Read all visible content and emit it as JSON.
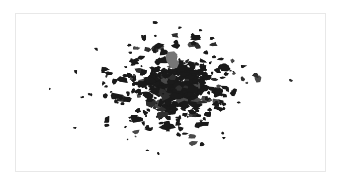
{
  "figure": {
    "kind": "map-footprint-plot",
    "title": "",
    "background_color": "#ffffff",
    "frame": {
      "visible": true,
      "border_color": "#e8e8e8",
      "x": 15,
      "y": 13,
      "width": 311,
      "height": 159
    },
    "axes": {
      "visible": false,
      "ticks": false,
      "labels": false,
      "gridlines": false
    },
    "legend": {
      "visible": false
    }
  },
  "chart_data": {
    "type": "scatter",
    "title": "",
    "subtitle": "",
    "xlabel": "",
    "ylabel": "",
    "xlim": [
      0,
      311
    ],
    "ylim": [
      0,
      159
    ],
    "grid": false,
    "legend_position": "none",
    "marker_colors": {
      "primary": "#1a1a1a",
      "highlight": "#767676"
    },
    "series": [
      {
        "name": "building-footprints",
        "color": "#1a1a1a",
        "marker": "irregular-polygon",
        "count": 392,
        "note": "dense irregular dark polygons clustered in centre of frame"
      },
      {
        "name": "highlighted-footprint",
        "color": "#767676",
        "marker": "irregular-polygon",
        "count": 1,
        "note": "single larger grey polygon, upper-centre of frame"
      }
    ],
    "cluster_center": [
      160,
      75
    ],
    "cluster_spread": [
      62,
      40
    ]
  }
}
